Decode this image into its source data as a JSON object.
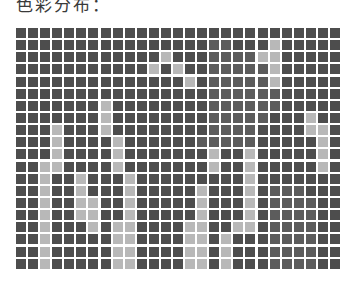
{
  "title": "色彩分布：",
  "palette": {
    "0": "#4d4d4d",
    "1": "#5c5c5c",
    "2": "#6b6b6b",
    "3": "#b8b8b8"
  },
  "grid": {
    "rows": 20,
    "cols": 27,
    "cells": [
      [
        0,
        0,
        0,
        0,
        0,
        0,
        0,
        0,
        0,
        0,
        0,
        0,
        0,
        0,
        0,
        0,
        0,
        0,
        0,
        0,
        0,
        0,
        0,
        0,
        0,
        0,
        0
      ],
      [
        0,
        0,
        0,
        0,
        0,
        0,
        0,
        0,
        0,
        0,
        0,
        0,
        0,
        0,
        0,
        0,
        1,
        1,
        0,
        0,
        0,
        3,
        0,
        0,
        0,
        0,
        0
      ],
      [
        0,
        0,
        0,
        0,
        0,
        0,
        0,
        0,
        0,
        0,
        0,
        0,
        3,
        0,
        0,
        0,
        1,
        1,
        1,
        1,
        3,
        3,
        0,
        0,
        0,
        0,
        0
      ],
      [
        0,
        0,
        0,
        0,
        0,
        0,
        0,
        0,
        0,
        0,
        0,
        3,
        0,
        3,
        0,
        0,
        1,
        1,
        1,
        1,
        1,
        3,
        0,
        0,
        0,
        0,
        0
      ],
      [
        0,
        0,
        0,
        0,
        0,
        0,
        0,
        0,
        0,
        0,
        0,
        0,
        0,
        0,
        3,
        0,
        1,
        1,
        1,
        1,
        1,
        3,
        0,
        0,
        0,
        0,
        0
      ],
      [
        0,
        0,
        0,
        0,
        0,
        0,
        0,
        0,
        0,
        0,
        0,
        0,
        0,
        0,
        0,
        0,
        1,
        1,
        1,
        1,
        1,
        1,
        0,
        0,
        0,
        0,
        0
      ],
      [
        0,
        0,
        0,
        0,
        0,
        0,
        0,
        3,
        0,
        0,
        0,
        0,
        0,
        0,
        0,
        0,
        1,
        1,
        1,
        1,
        1,
        1,
        0,
        0,
        0,
        0,
        0
      ],
      [
        0,
        0,
        0,
        0,
        0,
        0,
        0,
        3,
        0,
        0,
        0,
        0,
        0,
        0,
        0,
        0,
        1,
        1,
        1,
        1,
        1,
        0,
        0,
        0,
        3,
        0,
        0
      ],
      [
        0,
        0,
        0,
        3,
        0,
        0,
        0,
        3,
        0,
        0,
        0,
        0,
        0,
        0,
        0,
        0,
        1,
        1,
        1,
        1,
        0,
        0,
        0,
        0,
        3,
        3,
        0
      ],
      [
        0,
        0,
        0,
        3,
        0,
        0,
        0,
        0,
        3,
        0,
        0,
        0,
        0,
        0,
        0,
        1,
        1,
        1,
        1,
        1,
        0,
        0,
        0,
        0,
        0,
        3,
        0
      ],
      [
        0,
        0,
        0,
        3,
        0,
        0,
        0,
        0,
        3,
        0,
        0,
        0,
        0,
        0,
        0,
        0,
        3,
        0,
        0,
        3,
        0,
        0,
        0,
        0,
        0,
        3,
        0
      ],
      [
        0,
        0,
        3,
        3,
        0,
        0,
        0,
        0,
        3,
        0,
        0,
        0,
        0,
        0,
        0,
        0,
        3,
        0,
        0,
        3,
        0,
        0,
        0,
        0,
        0,
        3,
        0
      ],
      [
        0,
        0,
        3,
        0,
        0,
        3,
        0,
        0,
        0,
        3,
        0,
        0,
        0,
        0,
        0,
        0,
        0,
        0,
        0,
        3,
        0,
        0,
        0,
        0,
        0,
        0,
        0
      ],
      [
        0,
        0,
        3,
        0,
        0,
        3,
        0,
        0,
        0,
        3,
        0,
        0,
        0,
        0,
        0,
        3,
        0,
        0,
        0,
        3,
        0,
        1,
        1,
        1,
        0,
        0,
        0
      ],
      [
        0,
        0,
        3,
        0,
        0,
        3,
        3,
        0,
        0,
        3,
        0,
        0,
        0,
        0,
        0,
        3,
        0,
        0,
        0,
        3,
        0,
        1,
        1,
        1,
        1,
        0,
        0
      ],
      [
        0,
        0,
        3,
        0,
        0,
        3,
        3,
        0,
        0,
        3,
        0,
        0,
        0,
        0,
        0,
        3,
        0,
        0,
        0,
        3,
        0,
        1,
        1,
        1,
        1,
        0,
        0
      ],
      [
        0,
        0,
        3,
        0,
        0,
        0,
        3,
        0,
        3,
        3,
        0,
        0,
        0,
        0,
        3,
        3,
        0,
        0,
        3,
        3,
        0,
        1,
        1,
        1,
        1,
        0,
        0
      ],
      [
        0,
        0,
        3,
        0,
        0,
        0,
        0,
        0,
        3,
        3,
        0,
        0,
        0,
        0,
        3,
        3,
        0,
        3,
        0,
        0,
        0,
        1,
        1,
        1,
        1,
        0,
        0
      ],
      [
        0,
        0,
        3,
        0,
        0,
        0,
        0,
        0,
        3,
        3,
        0,
        0,
        0,
        0,
        3,
        3,
        0,
        3,
        0,
        0,
        0,
        1,
        1,
        1,
        1,
        0,
        0
      ],
      [
        0,
        0,
        3,
        0,
        0,
        0,
        0,
        0,
        3,
        3,
        0,
        0,
        0,
        0,
        3,
        3,
        0,
        3,
        0,
        0,
        0,
        1,
        1,
        1,
        1,
        0,
        0
      ]
    ]
  }
}
